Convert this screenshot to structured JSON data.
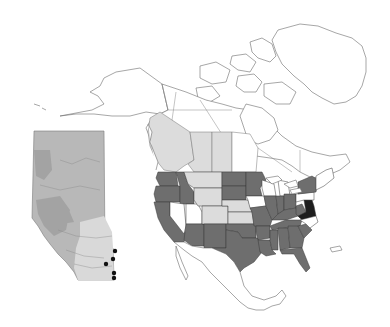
{
  "map": {
    "title": "",
    "region": "North America",
    "projection": "conic (Lambert-style)",
    "legend": [],
    "colors": {
      "background": "#ffffff",
      "land_unshaded": "#ffffff",
      "outline": "#6b6b6b",
      "shade_light": "#dcdcdc",
      "shade_medium": "#6e6e6e",
      "shade_dark": "#1e1e1e",
      "inset_fill": "#b8b8b8",
      "inset_light": "#d9d9d9",
      "inset_dark": "#9a9a9a",
      "point_marker": "#111111"
    },
    "shading_classes": {
      "light_gray": [
        "British Columbia",
        "Alberta",
        "Saskatchewan",
        "Montana",
        "Wyoming",
        "Colorado",
        "Nebraska",
        "South Dakota (part)"
      ],
      "medium_gray": [
        "Washington",
        "Oregon",
        "California",
        "Idaho",
        "Arizona",
        "New Mexico",
        "Texas",
        "Oklahoma",
        "Kansas (part)",
        "North Dakota",
        "Minnesota",
        "Missouri",
        "Arkansas",
        "Louisiana",
        "Mississippi",
        "Alabama",
        "Georgia",
        "Florida",
        "South Carolina",
        "Tennessee",
        "Kentucky",
        "Illinois",
        "Indiana",
        "Ohio",
        "West Virginia",
        "New York"
      ],
      "dark": [
        "Virginia",
        "Maryland",
        "Delaware"
      ],
      "white": [
        "Nevada",
        "Utah",
        "Iowa",
        "Wisconsin",
        "Michigan",
        "Pennsylvania",
        "North Carolina",
        "New England",
        "Manitoba",
        "Ontario",
        "Quebec",
        "Alaska",
        "Yukon",
        "Northwest Territories",
        "Nunavut",
        "Greenland",
        "Mexico"
      ]
    },
    "inset": {
      "label": "Alberta",
      "position": "left",
      "marker_count": 5,
      "markers": [
        {
          "x": 116,
          "y": 251
        },
        {
          "x": 113,
          "y": 259
        },
        {
          "x": 106,
          "y": 264
        },
        {
          "x": 114,
          "y": 273
        },
        {
          "x": 114,
          "y": 278
        }
      ]
    }
  }
}
